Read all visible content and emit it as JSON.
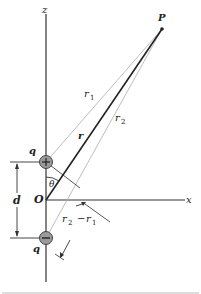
{
  "diagram": {
    "axes": {
      "z_label": "z",
      "x_label": "x",
      "origin_label": "O"
    },
    "point": {
      "label": "P"
    },
    "charges": [
      {
        "label": "q",
        "sign": "+",
        "sign_glyph": "+"
      },
      {
        "label": "q",
        "sign": "-",
        "sign_glyph": "−"
      }
    ],
    "distances": {
      "r": "r",
      "r1": "r",
      "r1_sub": "1",
      "r2": "r",
      "r2_sub": "2",
      "d": "d",
      "diff_r2": "r",
      "diff_r2_sub": "2",
      "diff_minus": "−",
      "diff_r1": "r",
      "diff_r1_sub": "1"
    },
    "angle": {
      "label": "θ"
    },
    "colors": {
      "line": "#333333",
      "light_line": "#b5b5b5",
      "charge_fill": "#9a9a9a",
      "charge_stroke": "#444444"
    }
  }
}
